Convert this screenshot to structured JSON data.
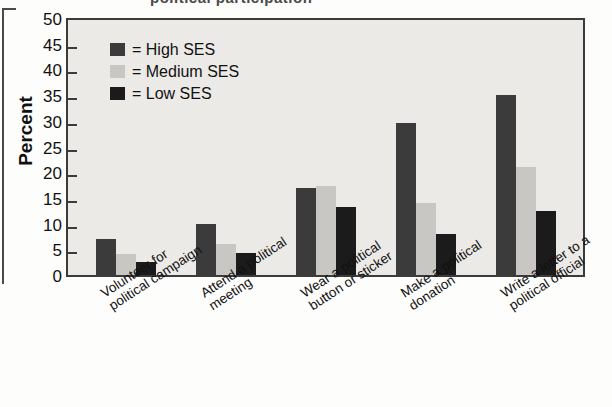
{
  "figure": {
    "top_fragment": "political participation",
    "y_axis_title": "Percent"
  },
  "legend": {
    "items": [
      {
        "key": "high",
        "label": "= High SES",
        "color": "#3b3b3b"
      },
      {
        "key": "medium",
        "label": "= Medium SES",
        "color": "#c9c7c4"
      },
      {
        "key": "low",
        "label": "= Low SES",
        "color": "#1b1b1b"
      }
    ]
  },
  "chart_data": {
    "type": "bar",
    "title": "",
    "xlabel": "",
    "ylabel": "Percent",
    "ylim": [
      0,
      50
    ],
    "yticks": [
      0,
      5,
      10,
      15,
      20,
      25,
      30,
      35,
      40,
      45,
      50
    ],
    "grid": false,
    "legend_position": "top-left inside plot",
    "categories": [
      "Volunteer for political campaign",
      "Attend a political meeting",
      "Wear a political button or sticker",
      "Make a political donation",
      "Write a letter to a political official"
    ],
    "category_lines": [
      [
        "Volunteer for",
        "political campaign"
      ],
      [
        "Attend a political",
        "meeting"
      ],
      [
        "Wear a political",
        "button or sticker"
      ],
      [
        "Make a political",
        "donation"
      ],
      [
        "Write a letter to a",
        "political official"
      ]
    ],
    "series": [
      {
        "name": "High SES",
        "color": "#3b3b3b",
        "values": [
          7,
          10,
          17,
          29.5,
          35
        ]
      },
      {
        "name": "Medium SES",
        "color": "#c9c7c4",
        "values": [
          4,
          6,
          17.3,
          14,
          21
        ]
      },
      {
        "name": "Low SES",
        "color": "#1b1b1b",
        "values": [
          2.5,
          4.2,
          13.3,
          8,
          12.5
        ]
      }
    ]
  }
}
